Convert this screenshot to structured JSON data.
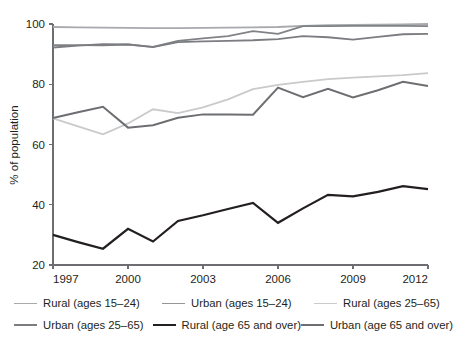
{
  "chart_data": {
    "type": "line",
    "title": "",
    "xlabel": "",
    "ylabel": "% of population",
    "xlim": [
      1997,
      2012
    ],
    "ylim": [
      20,
      100
    ],
    "ytick_labels": [
      "20",
      "40",
      "60",
      "80",
      "100"
    ],
    "yticks": [
      20,
      40,
      60,
      80,
      100
    ],
    "xtick_labels": [
      "1997",
      "2000",
      "2003",
      "2006",
      "2009",
      "2012"
    ],
    "xticks": [
      1997,
      2000,
      2003,
      2006,
      2009,
      2012
    ],
    "grid": false,
    "legend_position": "below",
    "x": [
      1997,
      1998,
      1999,
      2000,
      2001,
      2002,
      2003,
      2004,
      2005,
      2006,
      2007,
      2008,
      2009,
      2010,
      2011,
      2012
    ],
    "series": [
      {
        "name": "Rural (ages 15–24)",
        "color": "#a7a9ac",
        "width": 1.8,
        "values": [
          99.0,
          98.9,
          98.8,
          98.7,
          98.6,
          98.6,
          98.7,
          98.8,
          98.9,
          99.0,
          99.4,
          99.6,
          99.7,
          99.8,
          99.9,
          100.0
        ]
      },
      {
        "name": "Urban (ages 15–24)",
        "color": "#808285",
        "width": 1.8,
        "values": [
          93.0,
          93.0,
          92.9,
          93.2,
          92.4,
          94.4,
          95.2,
          96.0,
          97.6,
          96.7,
          99.3,
          99.3,
          99.4,
          99.4,
          99.4,
          99.3
        ]
      },
      {
        "name": "Rural (ages 25–65)",
        "color": "#c8cacb",
        "width": 1.8,
        "values": [
          68.7,
          66.0,
          63.4,
          67.0,
          71.7,
          70.4,
          72.3,
          75.0,
          78.4,
          79.8,
          80.8,
          81.7,
          82.2,
          82.6,
          83.0,
          83.7
        ]
      },
      {
        "name": "Urban (ages 25–65)",
        "color": "#7b7d80",
        "width": 1.8,
        "values": [
          92.2,
          92.8,
          93.3,
          93.2,
          92.3,
          94.0,
          94.2,
          94.4,
          94.6,
          95.0,
          96.0,
          95.6,
          94.8,
          95.7,
          96.6,
          96.7
        ]
      },
      {
        "name": "Rural (age 65 and over)",
        "color": "#231f20",
        "width": 2.2,
        "values": [
          30.0,
          27.6,
          25.4,
          32.0,
          27.8,
          34.6,
          36.5,
          38.6,
          40.6,
          34.0,
          38.8,
          43.3,
          42.8,
          44.3,
          46.2,
          45.2
        ]
      },
      {
        "name": "Urban (age 65 and over)",
        "color": "#6d6e71",
        "width": 2.0,
        "values": [
          68.8,
          70.7,
          72.5,
          65.6,
          66.4,
          68.9,
          70.0,
          70.0,
          69.9,
          78.9,
          75.7,
          78.5,
          75.6,
          78.0,
          80.8,
          79.4
        ]
      }
    ]
  },
  "legend": {
    "row1": [
      {
        "label": "Rural (ages 15–24)",
        "color": "#a7a9ac",
        "width": "1.9px"
      },
      {
        "label": "Urban (ages 15–24)",
        "color": "#949699",
        "width": "1.9px"
      },
      {
        "label": "Rural (ages 25–65)",
        "color": "#c8cacb",
        "width": "1.9px"
      }
    ],
    "row2": [
      {
        "label": "Urban (ages 25–65)",
        "color": "#7b7d80",
        "width": "2.0px"
      },
      {
        "label": "Rural (age 65 and over)",
        "color": "#231f20",
        "width": "2.4px"
      },
      {
        "label": "Urban (age 65 and over)",
        "color": "#6d6e71",
        "width": "2.2px"
      }
    ]
  }
}
